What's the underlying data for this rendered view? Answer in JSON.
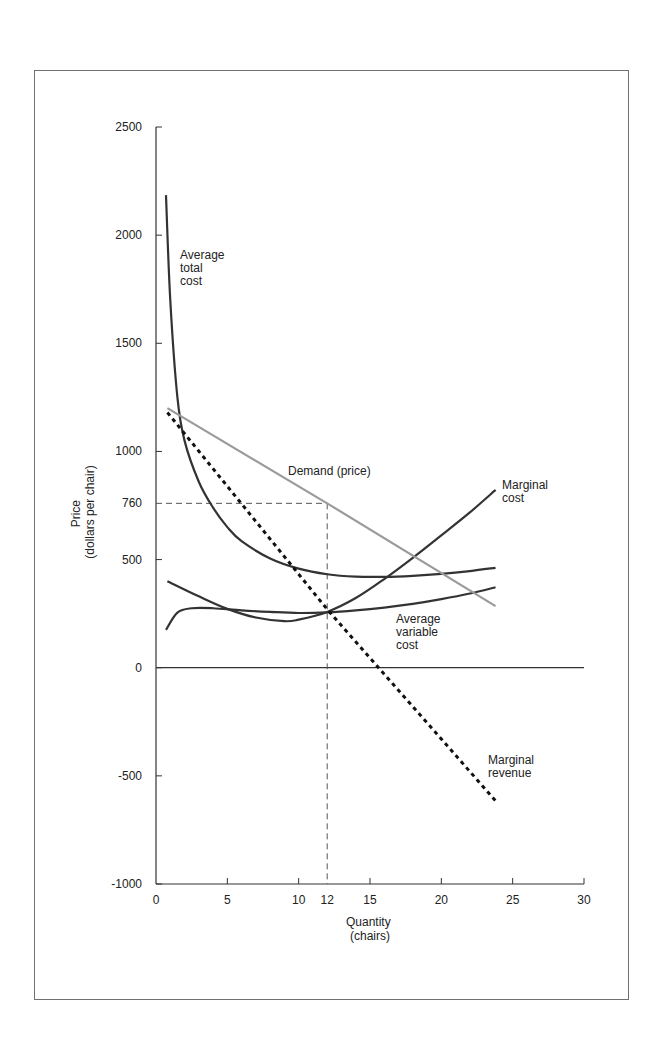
{
  "chart_data": {
    "type": "line",
    "title": "",
    "xlabel": "Quantity",
    "xlabel_sub": "(chairs)",
    "ylabel": "Price",
    "ylabel_sub": "(dollars per chair)",
    "xlim": [
      0,
      30
    ],
    "ylim": [
      -1000,
      2500
    ],
    "x_ticks": [
      0,
      5,
      10,
      12,
      15,
      20,
      25,
      30
    ],
    "y_ticks": [
      -1000,
      -500,
      0,
      500,
      760,
      1000,
      1500,
      2000,
      2500
    ],
    "grid": false,
    "zero_line": true,
    "series": [
      {
        "name": "Average total cost",
        "label_lines": [
          "Average",
          "total",
          "cost"
        ],
        "style": "solid-dark",
        "color": "#333333",
        "points": [
          [
            0.7,
            2185
          ],
          [
            1,
            1700
          ],
          [
            1.5,
            1250
          ],
          [
            2,
            1050
          ],
          [
            3,
            860
          ],
          [
            4,
            740
          ],
          [
            5,
            650
          ],
          [
            6,
            585
          ],
          [
            8,
            505
          ],
          [
            10,
            458
          ],
          [
            12,
            432
          ],
          [
            14,
            421
          ],
          [
            16,
            420
          ],
          [
            18,
            425
          ],
          [
            20,
            434
          ],
          [
            22,
            447
          ],
          [
            23.8,
            462
          ]
        ]
      },
      {
        "name": "Marginal cost",
        "label_lines": [
          "Marginal",
          "cost"
        ],
        "style": "solid-dark",
        "color": "#333333",
        "points": [
          [
            0.8,
            400
          ],
          [
            3,
            330
          ],
          [
            5,
            272
          ],
          [
            7,
            232
          ],
          [
            9,
            215
          ],
          [
            10,
            222
          ],
          [
            12,
            258
          ],
          [
            14,
            322
          ],
          [
            16,
            410
          ],
          [
            18,
            508
          ],
          [
            20,
            612
          ],
          [
            22,
            718
          ],
          [
            23.8,
            822
          ]
        ]
      },
      {
        "name": "Average variable cost",
        "label_lines": [
          "Average",
          "variable",
          "cost"
        ],
        "style": "solid-dark",
        "color": "#333333",
        "points": [
          [
            0.7,
            175
          ],
          [
            1.5,
            255
          ],
          [
            2.5,
            275
          ],
          [
            4,
            275
          ],
          [
            6,
            265
          ],
          [
            8,
            258
          ],
          [
            10,
            253
          ],
          [
            12,
            256
          ],
          [
            14,
            265
          ],
          [
            16,
            278
          ],
          [
            18,
            295
          ],
          [
            20,
            317
          ],
          [
            22,
            343
          ],
          [
            23.8,
            372
          ]
        ]
      },
      {
        "name": "Demand (price)",
        "label_lines": [
          "Demand (price)"
        ],
        "style": "solid-gray",
        "color": "#9a9a9a",
        "points": [
          [
            0.8,
            1200
          ],
          [
            12,
            760
          ],
          [
            23.8,
            285
          ]
        ]
      },
      {
        "name": "Marginal revenue",
        "label_lines": [
          "Marginal",
          "revenue"
        ],
        "style": "dotted",
        "color": "#111111",
        "points": [
          [
            0.8,
            1180
          ],
          [
            12,
            270
          ],
          [
            23.8,
            -615
          ]
        ]
      }
    ],
    "annotations": [
      {
        "type": "dashed-guide",
        "from": [
          0,
          760
        ],
        "to": [
          12,
          760
        ],
        "label": "760"
      },
      {
        "type": "dashed-guide",
        "from": [
          12,
          760
        ],
        "to": [
          12,
          -1000
        ],
        "label": "12"
      }
    ]
  }
}
